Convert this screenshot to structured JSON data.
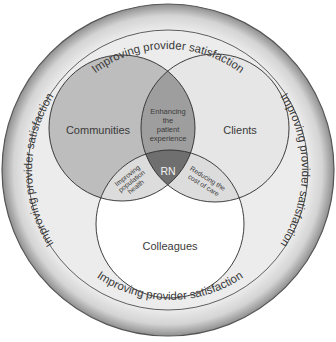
{
  "diagram": {
    "ring_label": "Improving provider satisfaction",
    "ring_labels": [
      "Improving provider satisfaction",
      "Improving provider satisfaction",
      "Improving provider satisfaction",
      "Improving provider satisfaction"
    ],
    "circles": {
      "communities": "Communities",
      "clients": "Clients",
      "colleagues": "Colleagues"
    },
    "overlaps": {
      "communities_clients": [
        "Enhancing",
        "the",
        "patient",
        "experience"
      ],
      "communities_colleagues": [
        "Improving",
        "population",
        "health"
      ],
      "clients_colleagues": [
        "Reducing the",
        "cost of care"
      ],
      "center": "RN"
    },
    "colors": {
      "ring": "#d9d9d9",
      "communities": "#bdbdbd",
      "clients": "#e6e6e6",
      "colleagues": "#ffffff",
      "enhancing_overlap": "#9e9e9e",
      "lower_overlaps": "#dcdcdc",
      "center": "#6f6f6f",
      "stroke": "#2a2a2a"
    }
  }
}
